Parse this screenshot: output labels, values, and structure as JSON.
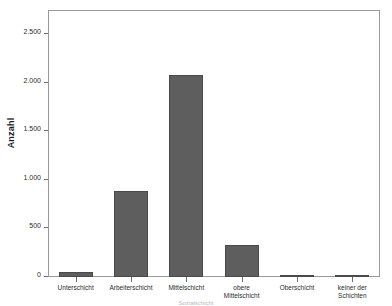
{
  "chart_data": {
    "type": "bar",
    "title": "",
    "subtitle": "",
    "xlabel": "",
    "ylabel": "Anzahl",
    "categories": [
      "Unterschicht",
      "Arbeiterschicht",
      "Mittelschicht",
      "obere\nMittelschicht",
      "Oberschicht",
      "keiner der\nSchichten"
    ],
    "values": [
      55,
      890,
      2080,
      330,
      25,
      20
    ],
    "ylim": [
      0,
      2750
    ],
    "ytick_values": [
      0,
      500,
      1000,
      1500,
      2000,
      2500
    ],
    "ytick_labels": [
      "0",
      "500",
      "1.000",
      "1.500",
      "2.000",
      "2.500"
    ],
    "grid": false,
    "legend": "none",
    "bar_color": "#5e5e5e",
    "bar_edge_color": "#4a4a4a",
    "frame_color": "#9a9a9a",
    "text_color": "#2b2b2b"
  },
  "axes": {
    "y_title": "Anzahl"
  },
  "footer": {
    "cut_caption": "Sozialschicht"
  }
}
